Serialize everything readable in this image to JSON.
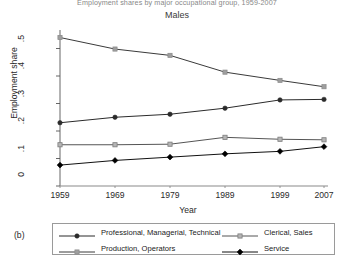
{
  "figure": {
    "main_title": "Employment shares by major occupational group, 1959-2007",
    "subtitle": "Males",
    "panel_label": "(b)"
  },
  "chart_data": {
    "type": "line",
    "title": "Males",
    "xlabel": "Year",
    "ylabel": "Employment share",
    "x": [
      1959,
      1969,
      1979,
      1989,
      1999,
      2007
    ],
    "xtick_labels": [
      "1959",
      "1969",
      "1979",
      "1989",
      "1999",
      "2007"
    ],
    "ytick_labels": [
      "0",
      ".1",
      ".2",
      ".3",
      ".4",
      ".5"
    ],
    "ytick_values": [
      0,
      0.1,
      0.2,
      0.3,
      0.4,
      0.5
    ],
    "xlim": [
      1959,
      2007
    ],
    "ylim": [
      0,
      0.56
    ],
    "grid": false,
    "legend_position": "below-axes",
    "series": [
      {
        "name": "Professional, Managerial, Technical",
        "marker": "filled-circle",
        "color": "#2b2b2b",
        "line_color": "#2b2b2b",
        "values": [
          0.23,
          0.25,
          0.261,
          0.283,
          0.313,
          0.315
        ]
      },
      {
        "name": "Clerical, Sales",
        "marker": "open-square",
        "color": "#9a9a9a",
        "line_color": "#555555",
        "values": [
          0.15,
          0.15,
          0.152,
          0.177,
          0.17,
          0.168
        ]
      },
      {
        "name": "Production, Operators",
        "marker": "light-triangle",
        "color": "#8c8c8c",
        "line_color": "#3a3a3a",
        "values": [
          0.54,
          0.498,
          0.475,
          0.414,
          0.384,
          0.361
        ]
      },
      {
        "name": "Service",
        "marker": "filled-diamond",
        "color": "#000000",
        "line_color": "#111111",
        "values": [
          0.076,
          0.093,
          0.105,
          0.117,
          0.126,
          0.143
        ]
      }
    ]
  }
}
